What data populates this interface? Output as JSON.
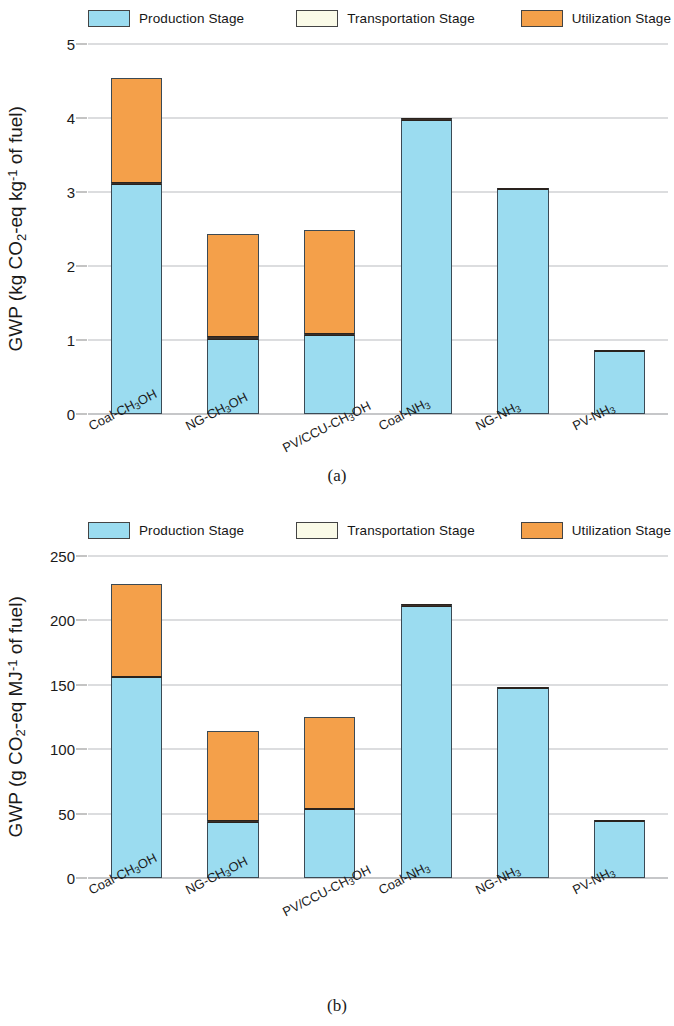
{
  "legend": {
    "items": [
      {
        "label": "Production Stage",
        "color": "#9bdcf0",
        "key": "production"
      },
      {
        "label": "Transportation Stage",
        "color": "#fbfbe8",
        "key": "transportation"
      },
      {
        "label": "Utilization Stage",
        "color": "#f4a04a",
        "key": "utilization"
      }
    ]
  },
  "captions": {
    "a": "(a)",
    "b": "(b)"
  },
  "chart_data": [
    {
      "id": "a",
      "type": "bar",
      "stacked": true,
      "title": "",
      "caption": "(a)",
      "xlabel": "",
      "ylabel": "GWP (kg CO2-eq kg-1 of fuel)",
      "ylabel_parts": {
        "prefix": "GWP (kg CO",
        "sub1": "2",
        "mid": "-eq kg",
        "sup1": "-1",
        "suffix": " of fuel)"
      },
      "ylim": [
        0,
        5
      ],
      "yticks": [
        0,
        1,
        2,
        3,
        4,
        5
      ],
      "ytick_labels": [
        "0",
        "1",
        "2",
        "3",
        "4",
        "5"
      ],
      "grid": true,
      "legend_position": "top",
      "categories": [
        "Coal-CH3OH",
        "NG-CH3OH",
        "PV/CCU-CH3OH",
        "Coal-NH3",
        "NG-NH3",
        "PV-NH3"
      ],
      "category_parts": [
        {
          "pre": "Coal-CH",
          "sub": "3",
          "post": "OH"
        },
        {
          "pre": "NG-CH",
          "sub": "3",
          "post": "OH"
        },
        {
          "pre": "PV/CCU-CH",
          "sub": "3",
          "post": "OH"
        },
        {
          "pre": "Coal-NH",
          "sub": "3",
          "post": ""
        },
        {
          "pre": "NG-NH",
          "sub": "3",
          "post": ""
        },
        {
          "pre": "PV-NH",
          "sub": "3",
          "post": ""
        }
      ],
      "series": [
        {
          "name": "Production Stage",
          "values": [
            3.1,
            1.0,
            1.06,
            3.96,
            3.03,
            0.84
          ]
        },
        {
          "name": "Transportation Stage",
          "values": [
            0.04,
            0.05,
            0.03,
            0.04,
            0.03,
            0.01
          ]
        },
        {
          "name": "Utilization Stage",
          "values": [
            1.4,
            1.38,
            1.4,
            0.0,
            0.0,
            0.0
          ]
        }
      ],
      "totals": [
        4.54,
        2.43,
        2.49,
        4.0,
        3.06,
        0.85
      ]
    },
    {
      "id": "b",
      "type": "bar",
      "stacked": true,
      "title": "",
      "caption": "(b)",
      "xlabel": "",
      "ylabel": "GWP (g CO2-eq MJ-1 of fuel)",
      "ylabel_parts": {
        "prefix": "GWP (g CO",
        "sub1": "2",
        "mid": "-eq MJ",
        "sup1": "-1",
        "suffix": " of fuel)"
      },
      "ylim": [
        0,
        250
      ],
      "yticks": [
        0,
        50,
        100,
        150,
        200,
        250
      ],
      "ytick_labels": [
        "0",
        "50",
        "100",
        "150",
        "200",
        "250"
      ],
      "grid": true,
      "legend_position": "top",
      "categories": [
        "Coal-CH3OH",
        "NG-CH3OH",
        "PV/CCU-CH3OH",
        "Coal-NH3",
        "NG-NH3",
        "PV-NH3"
      ],
      "category_parts": [
        {
          "pre": "Coal-CH",
          "sub": "3",
          "post": "OH"
        },
        {
          "pre": "NG-CH",
          "sub": "3",
          "post": "OH"
        },
        {
          "pre": "PV/CCU-CH",
          "sub": "3",
          "post": "OH"
        },
        {
          "pre": "Coal-NH",
          "sub": "3",
          "post": ""
        },
        {
          "pre": "NG-NH",
          "sub": "3",
          "post": ""
        },
        {
          "pre": "PV-NH",
          "sub": "3",
          "post": ""
        }
      ],
      "series": [
        {
          "name": "Production Stage",
          "values": [
            155.0,
            43.0,
            53.0,
            210.5,
            146.5,
            43.5
          ]
        },
        {
          "name": "Transportation Stage",
          "values": [
            2.0,
            2.0,
            1.5,
            2.0,
            1.5,
            0.5
          ]
        },
        {
          "name": "Utilization Stage",
          "values": [
            71.0,
            69.5,
            70.0,
            0.0,
            0.0,
            0.0
          ]
        }
      ],
      "totals": [
        228.0,
        114.5,
        124.5,
        212.5,
        148.0,
        44.0
      ]
    }
  ]
}
